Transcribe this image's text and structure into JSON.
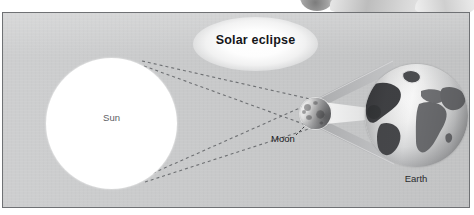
{
  "figure": {
    "title": "Solar eclipse",
    "background_color": "#c8c9ca",
    "border_color": "#6f7174"
  },
  "labels": {
    "sun": "Sun",
    "moon": "Moon",
    "earth": "Earth"
  },
  "diagram": {
    "type": "astronomy-schematic",
    "bodies": [
      {
        "name": "Sun",
        "label": "Sun",
        "shape": "circle",
        "center_x": 109,
        "center_y": 110,
        "radius": 65,
        "color": "#ffffff",
        "label_color": "#5d6064"
      },
      {
        "name": "Moon",
        "label": "Moon",
        "shape": "circle",
        "center_x": 312,
        "center_y": 100,
        "radius": 15,
        "color": "#9d9ea0",
        "label_color": "#17181b",
        "has_leader_line": true
      },
      {
        "name": "Earth",
        "label": "Earth",
        "shape": "circle",
        "center_x": 413,
        "center_y": 102,
        "radius": 51,
        "color": "#d8d9da",
        "label_color": "#2a2b2e",
        "continents": [
          "North America",
          "South America",
          "Europe",
          "Africa",
          "Asia"
        ]
      }
    ],
    "light_rays": {
      "style": "dashed",
      "color": "#6e7073",
      "dash": "3 3",
      "count": 4,
      "description": "tangent rays from top and bottom of Sun crossing at the Moon"
    },
    "shadow_cones": [
      {
        "name": "penumbra",
        "color": "#b0b1b3",
        "description": "wide light cone from Moon widening toward Earth"
      },
      {
        "name": "umbra",
        "color": "#f0f0f0",
        "description": "narrow bright-edged cone converging on Earth surface"
      }
    ],
    "title_glow": {
      "shape": "ellipse",
      "color": "#ffffff"
    }
  }
}
